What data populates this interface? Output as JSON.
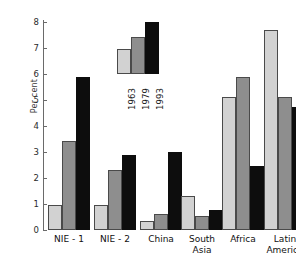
{
  "chart_data": {
    "type": "bar",
    "title": "",
    "subtitle": "",
    "xlabel": "",
    "ylabel": "Per cent",
    "ylim": [
      0,
      8
    ],
    "yticks": [
      0,
      1,
      2,
      3,
      4,
      5,
      6,
      7,
      8
    ],
    "ytick_labels": [
      "0",
      "1",
      "2",
      "3",
      "4",
      "5",
      "6",
      "7",
      "8"
    ],
    "grid": false,
    "legend_position": "inside-upper-center",
    "categories": [
      "NIE - 1",
      "NIE - 2",
      "China",
      "South\nAsia",
      "Africa",
      "Latin\nAmerica"
    ],
    "series": [
      {
        "name": "1963",
        "color": "#d2d2d2",
        "values": [
          0.95,
          0.95,
          0.35,
          1.3,
          5.1,
          7.7
        ]
      },
      {
        "name": "1979",
        "color": "#8e8e8e",
        "values": [
          3.42,
          2.3,
          0.6,
          0.55,
          5.9,
          5.1
        ]
      },
      {
        "name": "1993",
        "color": "#0d0d0d",
        "values": [
          5.9,
          2.9,
          3.0,
          0.78,
          2.45,
          4.75
        ]
      }
    ],
    "legend_sample_values": [
      7.3,
      7.6,
      8.0
    ],
    "legend_entries": [
      "1963",
      "1979",
      "1993"
    ]
  },
  "axis": {
    "y_label": "Per cent"
  }
}
